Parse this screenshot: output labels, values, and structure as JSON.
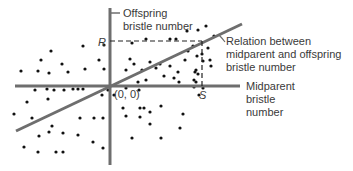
{
  "diagram": {
    "y_axis_label": [
      "Offspring",
      "bristle number"
    ],
    "x_axis_label": [
      "Midparent",
      "bristle",
      "number"
    ],
    "origin_label": "(0, 0)",
    "r_label": "R",
    "s_label": "S",
    "line_label": [
      "Relation between",
      "midparent and offspring",
      "bristle number"
    ],
    "colors": {
      "axis": "#6e6e6e",
      "line": "#6e6e6e",
      "dot": "#111111",
      "text": "#3a3a3a",
      "dash": "#222222"
    },
    "regression_slope_note": "positive",
    "points_description": "scatter of individual flies"
  },
  "chart_data": {
    "type": "scatter",
    "title": "",
    "xlabel": "Midparent bristle number",
    "ylabel": "Offspring bristle number",
    "xlim": [
      -95,
      130
    ],
    "ylim": [
      -79,
      78
    ],
    "origin": [
      0,
      0
    ],
    "regression": {
      "x0": -94,
      "y0": -45,
      "x1": 132,
      "y1": 62
    },
    "R_value": 45,
    "S_value": 92,
    "points": [
      [
        -89,
        15
      ],
      [
        -72,
        15
      ],
      [
        -61,
        13
      ],
      [
        -42,
        14
      ],
      [
        -25,
        17
      ],
      [
        -6,
        17
      ],
      [
        -69,
        26
      ],
      [
        -48,
        22
      ],
      [
        -27,
        40
      ],
      [
        -11,
        26
      ],
      [
        -59,
        35
      ],
      [
        -6,
        41
      ],
      [
        22,
        43
      ],
      [
        36,
        47
      ],
      [
        60,
        47
      ],
      [
        66,
        47
      ],
      [
        20,
        27
      ],
      [
        40,
        24
      ],
      [
        50,
        22
      ],
      [
        60,
        20
      ],
      [
        78,
        35
      ],
      [
        83,
        40
      ],
      [
        87,
        30
      ],
      [
        92,
        32
      ],
      [
        16,
        16
      ],
      [
        32,
        16
      ],
      [
        46,
        18
      ],
      [
        68,
        14
      ],
      [
        86,
        16
      ],
      [
        88,
        12
      ],
      [
        54,
        10
      ],
      [
        64,
        8
      ],
      [
        86,
        4
      ],
      [
        69,
        4
      ],
      [
        84,
        6
      ],
      [
        28,
        4
      ],
      [
        36,
        6
      ],
      [
        24,
        22
      ],
      [
        75,
        26
      ],
      [
        85,
        14
      ],
      [
        93,
        25
      ],
      [
        100,
        26
      ],
      [
        101,
        20
      ],
      [
        96,
        60
      ],
      [
        88,
        56
      ],
      [
        104,
        50
      ],
      [
        98,
        38
      ],
      [
        77,
        55
      ],
      [
        -75,
        -4
      ],
      [
        -63,
        -3
      ],
      [
        -56,
        -4
      ],
      [
        -46,
        -4
      ],
      [
        -37,
        -3
      ],
      [
        -32,
        -3
      ],
      [
        -27,
        -3
      ],
      [
        -8,
        -9
      ],
      [
        -83,
        -16
      ],
      [
        -62,
        -13
      ],
      [
        -96,
        -28
      ],
      [
        -78,
        -32
      ],
      [
        -30,
        -32
      ],
      [
        -16,
        -32
      ],
      [
        -7,
        -32
      ],
      [
        -58,
        -40
      ],
      [
        -71,
        -50
      ],
      [
        -61,
        -46
      ],
      [
        -47,
        -47
      ],
      [
        -32,
        -49
      ],
      [
        -17,
        -56
      ],
      [
        -86,
        -61
      ],
      [
        -72,
        -66
      ],
      [
        -54,
        -66
      ],
      [
        -47,
        -66
      ],
      [
        -7,
        -62
      ],
      [
        -2,
        -4
      ],
      [
        4,
        -9
      ],
      [
        13,
        -22
      ],
      [
        30,
        -22
      ],
      [
        16,
        -30
      ],
      [
        30,
        -31
      ],
      [
        29,
        -4
      ],
      [
        40,
        -26
      ],
      [
        51,
        -20
      ],
      [
        40,
        -38
      ],
      [
        70,
        -42
      ],
      [
        51,
        -52
      ],
      [
        22,
        -52
      ],
      [
        73,
        -28
      ],
      [
        16,
        -2
      ],
      [
        34,
        -22
      ],
      [
        84,
        -1
      ],
      [
        89,
        -9
      ],
      [
        93,
        -2
      ]
    ]
  }
}
